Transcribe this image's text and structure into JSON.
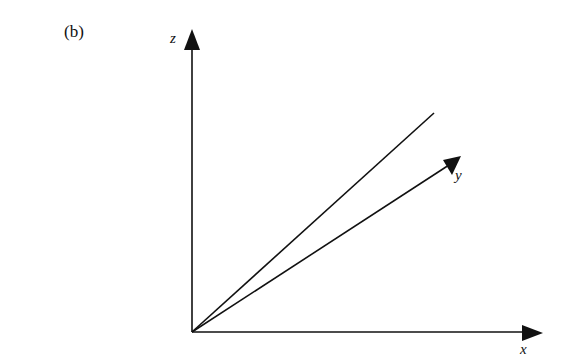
{
  "figure": {
    "panel_label": "(b)",
    "axes": {
      "z": {
        "label": "z"
      },
      "y": {
        "label": "y"
      },
      "x": {
        "label": "x"
      }
    },
    "colors": {
      "line": "#111111",
      "background": "#ffffff"
    }
  }
}
